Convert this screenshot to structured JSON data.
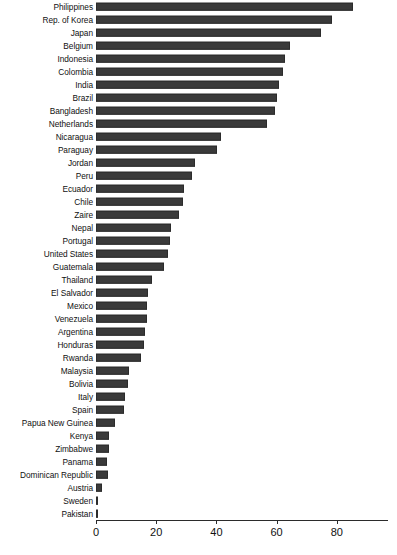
{
  "chart_data": {
    "type": "bar",
    "orientation": "horizontal",
    "title": "",
    "xlabel": "",
    "ylabel": "",
    "xlim": [
      0,
      97
    ],
    "xticks": [
      0,
      20,
      40,
      60,
      80
    ],
    "xtick_labels": [
      "0",
      "20",
      "40",
      "60",
      "80"
    ],
    "grid": false,
    "legend": false,
    "bar_color": "#3a3a3a",
    "categories": [
      "Philippines",
      "Rep. of Korea",
      "Japan",
      "Belgium",
      "Indonesia",
      "Colombia",
      "India",
      "Brazil",
      "Bangladesh",
      "Netherlands",
      "Nicaragua",
      "Paraguay",
      "Jordan",
      "Peru",
      "Ecuador",
      "Chile",
      "Zaire",
      "Nepal",
      "Portugal",
      "United States",
      "Guatemala",
      "Thailand",
      "El Salvador",
      "Mexico",
      "Venezuela",
      "Argentina",
      "Honduras",
      "Rwanda",
      "Malaysia",
      "Bolivia",
      "Italy",
      "Spain",
      "Papua New Guinea",
      "Kenya",
      "Zimbabwe",
      "Panama",
      "Dominican Republic",
      "Austria",
      "Sweden",
      "Pakistan"
    ],
    "values": [
      85.3,
      78.5,
      74.8,
      64.5,
      62.8,
      62.0,
      60.8,
      60.2,
      59.5,
      56.8,
      41.5,
      40.2,
      32.8,
      32.0,
      29.2,
      28.8,
      27.5,
      25.0,
      24.5,
      24.0,
      22.5,
      18.5,
      17.2,
      16.8,
      16.8,
      16.2,
      15.8,
      15.0,
      10.8,
      10.5,
      9.7,
      9.3,
      6.4,
      4.2,
      4.4,
      3.8,
      4.0,
      2.0,
      0.5,
      0.3
    ]
  }
}
